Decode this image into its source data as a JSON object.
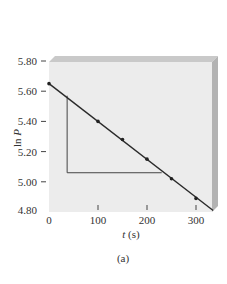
{
  "chart_data": {
    "type": "line",
    "title": "",
    "xlabel": "t (s)",
    "xlabel_var": "t",
    "xlabel_unit": "(s)",
    "ylabel": "ln P",
    "xlim": [
      0,
      340
    ],
    "ylim": [
      4.8,
      5.8
    ],
    "x_ticks": [
      0,
      100,
      200,
      300
    ],
    "x_tick_labels": [
      "0",
      "100",
      "200",
      "300"
    ],
    "y_ticks": [
      4.8,
      5.0,
      5.2,
      5.4,
      5.6,
      5.8
    ],
    "y_tick_labels": [
      "4.80",
      "5.00",
      "5.20",
      "5.40",
      "5.60",
      "5.80"
    ],
    "grid": false,
    "legend": null,
    "series": [
      {
        "name": "ln P vs t",
        "x": [
          0,
          100,
          150,
          200,
          250,
          300
        ],
        "y": [
          5.65,
          5.4,
          5.28,
          5.15,
          5.02,
          4.89
        ],
        "fit_line": {
          "x_start": 0,
          "y_start": 5.65,
          "x_end": 335,
          "y_end": 4.81
        }
      }
    ],
    "annotations": [
      {
        "type": "slope-triangle",
        "vertical_x": 37,
        "top_y": 5.57,
        "bottom_y": 5.06,
        "right_x": 230
      }
    ],
    "caption": "(a)",
    "colors": {
      "plot_bg": "#ececec",
      "frame_top": "#c8c8c8",
      "frame_right": "#b4b4b4",
      "line": "#2a2a2a"
    }
  }
}
